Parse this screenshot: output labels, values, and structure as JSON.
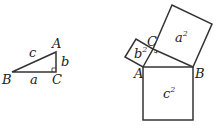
{
  "diagram": {
    "triangle": {
      "vertices": {
        "A": "A",
        "B": "B",
        "C": "C"
      },
      "sides": {
        "a": "a",
        "b": "b",
        "c": "c"
      }
    },
    "squares_figure": {
      "vertices": {
        "A": "A",
        "B": "B",
        "C": "C"
      },
      "areas": {
        "a2": "a",
        "b2": "b",
        "c2": "c"
      },
      "exponent": "2"
    },
    "colors": {
      "line": "#333333",
      "background": "#ffffff"
    }
  }
}
